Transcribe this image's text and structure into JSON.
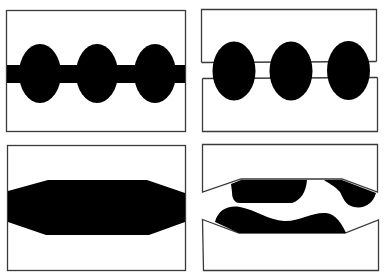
{
  "figure": {
    "width": 386,
    "height": 277,
    "background": "#ffffff",
    "stroke_color": "#3a3a3a",
    "fill_color": "#000000",
    "panels": [
      {
        "id": "a",
        "position": "top-left",
        "description": "Rod with three oval beads, no die contact"
      },
      {
        "id": "b",
        "position": "top-right",
        "description": "Three oval beads between open upper and lower die halves"
      },
      {
        "id": "c",
        "position": "bottom-left",
        "description": "Elongated octagonal flattened billet"
      },
      {
        "id": "d",
        "position": "bottom-right",
        "description": "Deformed material flowing between tapered die halves"
      }
    ]
  }
}
